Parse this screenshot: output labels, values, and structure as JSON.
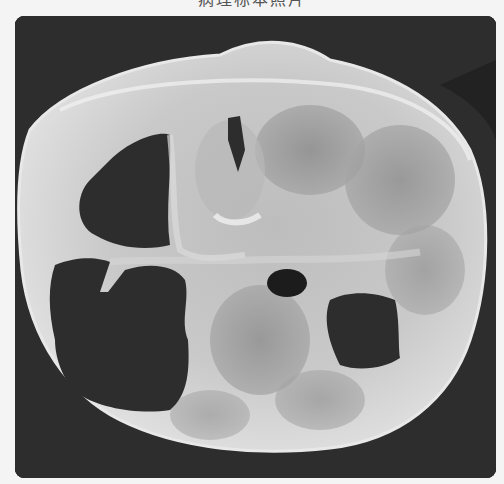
{
  "figure": {
    "caption": "病理标本照片",
    "background_color": "#2d2d2d",
    "tissue_color": "#cfcfcf"
  }
}
